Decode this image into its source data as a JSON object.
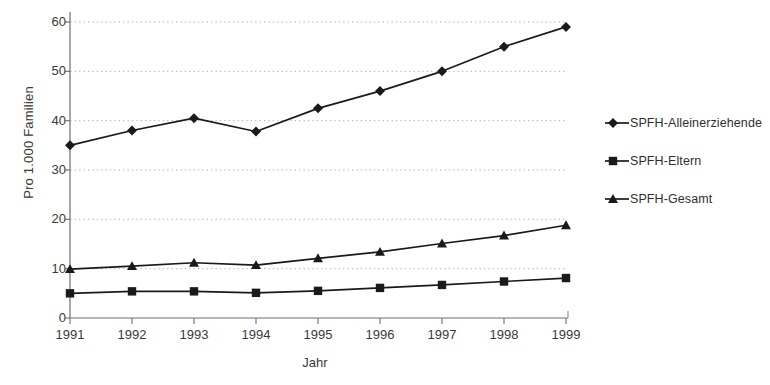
{
  "chart_data": {
    "type": "line",
    "title": "",
    "xlabel": "Jahr",
    "ylabel": "Pro 1.000 Familien",
    "categories": [
      "1991",
      "1992",
      "1993",
      "1994",
      "1995",
      "1996",
      "1997",
      "1998",
      "1999"
    ],
    "x": [
      1991,
      1992,
      1993,
      1994,
      1995,
      1996,
      1997,
      1998,
      1999
    ],
    "xlim": [
      1990.6,
      1999.6
    ],
    "ylim": [
      0,
      60
    ],
    "yticks": [
      0,
      10,
      20,
      30,
      40,
      50,
      60
    ],
    "ytick_labels": [
      "0",
      "10",
      "20",
      "30",
      "40",
      "50",
      "60"
    ],
    "grid": "horizontal-dotted",
    "legend_position": "right",
    "series": [
      {
        "name": "SPFH-Alleinerziehende",
        "marker": "diamond",
        "color": "#1a1a1a",
        "values": [
          35.0,
          38.0,
          40.5,
          37.8,
          42.5,
          46.0,
          50.0,
          55.0,
          59.0
        ]
      },
      {
        "name": "SPFH-Eltern",
        "marker": "square",
        "color": "#1a1a1a",
        "values": [
          5.0,
          5.4,
          5.4,
          5.1,
          5.5,
          6.1,
          6.7,
          7.4,
          8.1
        ]
      },
      {
        "name": "SPFH-Gesamt",
        "marker": "triangle",
        "color": "#1a1a1a",
        "values": [
          9.9,
          10.5,
          11.2,
          10.7,
          12.1,
          13.4,
          15.1,
          16.7,
          18.8
        ]
      }
    ]
  },
  "axes": {
    "y_title": "Pro 1.000 Familien",
    "x_title": "Jahr"
  },
  "legend": {
    "items": [
      {
        "label": "SPFH-Alleinerziehende",
        "marker": "diamond-marker-icon"
      },
      {
        "label": "SPFH-Eltern",
        "marker": "square-marker-icon"
      },
      {
        "label": "SPFH-Gesamt",
        "marker": "triangle-marker-icon"
      }
    ]
  }
}
